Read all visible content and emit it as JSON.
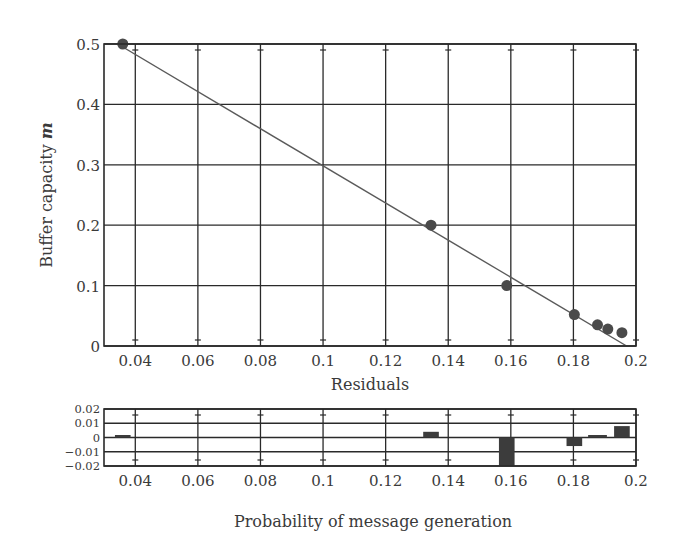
{
  "chart_data": [
    {
      "type": "scatter",
      "title": "",
      "xlabel": "Residuals",
      "ylabel": "Buffer capacity m",
      "ylabel_main": "Buffer capacity ",
      "ylabel_var": "m",
      "xlim": [
        0.03,
        0.2
      ],
      "ylim": [
        0,
        0.5
      ],
      "grid": true,
      "x_ticks": [
        0.04,
        0.06,
        0.08,
        0.1,
        0.12,
        0.14,
        0.16,
        0.18,
        0.2
      ],
      "x_tick_labels": [
        "0.04",
        "0.06",
        "0.08",
        "0.1",
        "0.12",
        "0.14",
        "0.16",
        "0.18",
        "0.2"
      ],
      "y_ticks": [
        0,
        0.1,
        0.2,
        0.3,
        0.4,
        0.5
      ],
      "y_tick_labels": [
        "0",
        "0.1",
        "0.2",
        "0.3",
        "0.4",
        "0.5"
      ],
      "series": [
        {
          "name": "data",
          "kind": "points",
          "x": [
            0.036,
            0.1345,
            0.1587,
            0.1803,
            0.1877,
            0.191,
            0.1955
          ],
          "y": [
            0.5,
            0.2,
            0.1,
            0.052,
            0.035,
            0.028,
            0.022
          ]
        },
        {
          "name": "linear fit",
          "kind": "line",
          "x": [
            0.036,
            0.197
          ],
          "y": [
            0.495,
            0.0
          ]
        }
      ]
    },
    {
      "type": "bar",
      "title": "",
      "xlabel": "Probability of message generation",
      "ylabel": "",
      "xlim": [
        0.03,
        0.2
      ],
      "ylim": [
        -0.02,
        0.02
      ],
      "grid": true,
      "x_ticks": [
        0.04,
        0.06,
        0.08,
        0.1,
        0.12,
        0.14,
        0.16,
        0.18,
        0.2
      ],
      "x_tick_labels": [
        "0.04",
        "0.06",
        "0.08",
        "0.1",
        "0.12",
        "0.14",
        "0.16",
        "0.18",
        "0.2"
      ],
      "y_ticks": [
        0.02,
        0.01,
        0,
        -0.01,
        -0.02
      ],
      "y_tick_labels": [
        "0.02",
        "0.01",
        "0",
        "−0.01",
        "−0.02"
      ],
      "series": [
        {
          "name": "residuals",
          "x": [
            0.036,
            0.1345,
            0.1587,
            0.1803,
            0.1877,
            0.1955
          ],
          "widths": [
            0.005,
            0.005,
            0.005,
            0.005,
            0.006,
            0.005
          ],
          "values": [
            0.001,
            0.004,
            -0.02,
            -0.006,
            0.001,
            0.008
          ]
        }
      ]
    }
  ],
  "colors": {
    "grid": "#2a2a2a",
    "points": "#4a4a4a",
    "fit_line": "#5a5a5a",
    "bars": "#3c3c3c",
    "text": "#3a3a3a"
  }
}
